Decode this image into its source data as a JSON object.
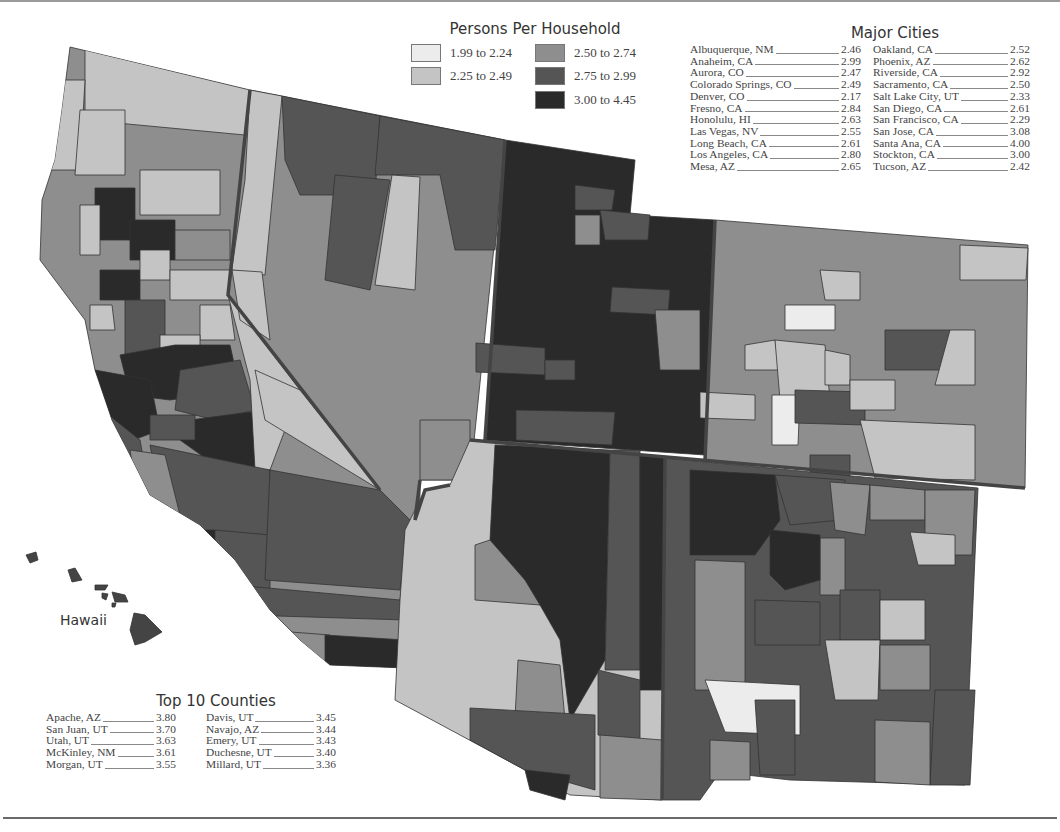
{
  "legend": {
    "title": "Persons Per Household",
    "items": [
      {
        "label": "1.99 to 2.24",
        "color": "#ececec"
      },
      {
        "label": "2.25 to 2.49",
        "color": "#c4c4c4"
      },
      {
        "label": "2.50 to 2.74",
        "color": "#8e8e8e"
      },
      {
        "label": "2.75 to 2.99",
        "color": "#555555"
      },
      {
        "label": "3.00 to 4.45",
        "color": "#2a2a2a"
      }
    ]
  },
  "major_cities": {
    "title": "Major Cities",
    "left": [
      {
        "name": "Albuquerque, NM",
        "value": "2.46"
      },
      {
        "name": "Anaheim, CA",
        "value": "2.99"
      },
      {
        "name": "Aurora, CO",
        "value": "2.47"
      },
      {
        "name": "Colorado Springs, CO",
        "value": "2.49"
      },
      {
        "name": "Denver, CO",
        "value": "2.17"
      },
      {
        "name": "Fresno, CA",
        "value": "2.84"
      },
      {
        "name": "Honolulu, HI",
        "value": "2.63"
      },
      {
        "name": "Las Vegas, NV",
        "value": "2.55"
      },
      {
        "name": "Long Beach, CA",
        "value": "2.61"
      },
      {
        "name": "Los Angeles, CA",
        "value": "2.80"
      },
      {
        "name": "Mesa, AZ",
        "value": "2.65"
      }
    ],
    "right": [
      {
        "name": "Oakland, CA",
        "value": "2.52"
      },
      {
        "name": "Phoenix, AZ",
        "value": "2.62"
      },
      {
        "name": "Riverside, CA",
        "value": "2.92"
      },
      {
        "name": "Sacramento, CA",
        "value": "2.50"
      },
      {
        "name": "Salt Lake City, UT",
        "value": "2.33"
      },
      {
        "name": "San Diego, CA",
        "value": "2.61"
      },
      {
        "name": "San Francisco, CA",
        "value": "2.29"
      },
      {
        "name": "San Jose, CA",
        "value": "3.08"
      },
      {
        "name": "Santa Ana, CA",
        "value": "4.00"
      },
      {
        "name": "Stockton, CA",
        "value": "3.00"
      },
      {
        "name": "Tucson, AZ",
        "value": "2.42"
      }
    ]
  },
  "top_counties": {
    "title": "Top 10 Counties",
    "left": [
      {
        "name": "Apache, AZ",
        "value": "3.80"
      },
      {
        "name": "San Juan, UT",
        "value": "3.70"
      },
      {
        "name": "Utah, UT",
        "value": "3.63"
      },
      {
        "name": "McKinley, NM",
        "value": "3.61"
      },
      {
        "name": "Morgan, UT",
        "value": "3.55"
      }
    ],
    "right": [
      {
        "name": "Davis, UT",
        "value": "3.45"
      },
      {
        "name": "Navajo, AZ",
        "value": "3.44"
      },
      {
        "name": "Emery, UT",
        "value": "3.43"
      },
      {
        "name": "Duchesne, UT",
        "value": "3.40"
      },
      {
        "name": "Millard, UT",
        "value": "3.36"
      }
    ]
  },
  "map": {
    "hawaii_label": "Hawaii",
    "states": [
      "California",
      "Nevada",
      "Utah",
      "Colorado",
      "Arizona",
      "New Mexico",
      "Hawaii"
    ]
  }
}
